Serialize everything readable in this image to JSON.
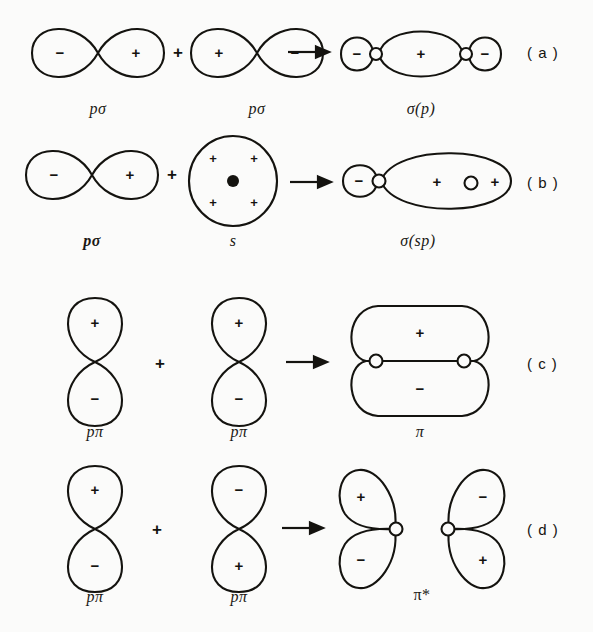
{
  "figure": {
    "background_color": "#fbfbfa",
    "ink_color": "#14130f",
    "operator_plus": "+",
    "arrow": "arrow-right"
  },
  "rows": [
    {
      "id": "a",
      "row_label": "( a )",
      "terms": [
        {
          "name": "p-sigma-orbital-left",
          "type": "p-horizontal",
          "caption": "pσ",
          "caption_bold": false,
          "lobes": [
            {
              "position": "left",
              "sign": "−"
            },
            {
              "position": "right",
              "sign": "+"
            }
          ]
        },
        {
          "name": "p-sigma-orbital-right",
          "type": "p-horizontal",
          "caption": "pσ",
          "caption_bold": false,
          "lobes": [
            {
              "position": "left",
              "sign": "+"
            },
            {
              "position": "right",
              "sign": "−"
            }
          ]
        },
        {
          "name": "sigma-p-molecular-orbital",
          "type": "sigma-bonding-p",
          "caption": "σ(p)",
          "caption_bold": false,
          "lobes": [
            {
              "position": "left-small",
              "sign": "−"
            },
            {
              "position": "center-large",
              "sign": "+"
            },
            {
              "position": "right-small",
              "sign": "−"
            }
          ],
          "nuclei": 2
        }
      ]
    },
    {
      "id": "b",
      "row_label": "( b )",
      "terms": [
        {
          "name": "p-sigma-orbital",
          "type": "p-horizontal",
          "caption": "pσ",
          "caption_bold": true,
          "lobes": [
            {
              "position": "left",
              "sign": "−"
            },
            {
              "position": "right",
              "sign": "+"
            }
          ]
        },
        {
          "name": "s-orbital",
          "type": "s-sphere",
          "caption": "s",
          "caption_bold": false,
          "signs": [
            "+",
            "+",
            "+",
            "+"
          ],
          "nucleus": "filled-dot"
        },
        {
          "name": "sigma-sp-molecular-orbital",
          "type": "sigma-bonding-sp",
          "caption": "σ(sp)",
          "caption_bold": false,
          "lobes": [
            {
              "position": "left-small",
              "sign": "−"
            },
            {
              "position": "right-large",
              "sign": "+"
            }
          ],
          "inner_signs": [
            "+",
            "+"
          ],
          "nuclei": 2
        }
      ]
    },
    {
      "id": "c",
      "row_label": "( c )",
      "terms": [
        {
          "name": "p-pi-orbital-left",
          "type": "p-vertical",
          "caption": "pπ",
          "caption_bold": false,
          "lobes": [
            {
              "position": "top",
              "sign": "+"
            },
            {
              "position": "bottom",
              "sign": "−"
            }
          ]
        },
        {
          "name": "p-pi-orbital-right",
          "type": "p-vertical",
          "caption": "pπ",
          "caption_bold": false,
          "lobes": [
            {
              "position": "top",
              "sign": "+"
            },
            {
              "position": "bottom",
              "sign": "−"
            }
          ]
        },
        {
          "name": "pi-bonding-orbital",
          "type": "pi-bonding",
          "caption": "π",
          "caption_bold": false,
          "lobes": [
            {
              "position": "top",
              "sign": "+"
            },
            {
              "position": "bottom",
              "sign": "−"
            }
          ],
          "nuclei": 2
        }
      ]
    },
    {
      "id": "d",
      "row_label": "( d )",
      "terms": [
        {
          "name": "p-pi-orbital-left",
          "type": "p-vertical",
          "caption": "pπ",
          "caption_bold": false,
          "lobes": [
            {
              "position": "top",
              "sign": "+"
            },
            {
              "position": "bottom",
              "sign": "−"
            }
          ]
        },
        {
          "name": "p-pi-orbital-right",
          "type": "p-vertical",
          "caption": "pπ",
          "caption_bold": false,
          "lobes": [
            {
              "position": "top",
              "sign": "−"
            },
            {
              "position": "bottom",
              "sign": "+"
            }
          ]
        },
        {
          "name": "pi-antibonding-orbital",
          "type": "pi-antibonding",
          "caption": "π*",
          "caption_bold": false,
          "left_half": {
            "top_sign": "+",
            "bottom_sign": "−"
          },
          "right_half": {
            "top_sign": "−",
            "bottom_sign": "+"
          },
          "nuclei": 2
        }
      ]
    }
  ]
}
